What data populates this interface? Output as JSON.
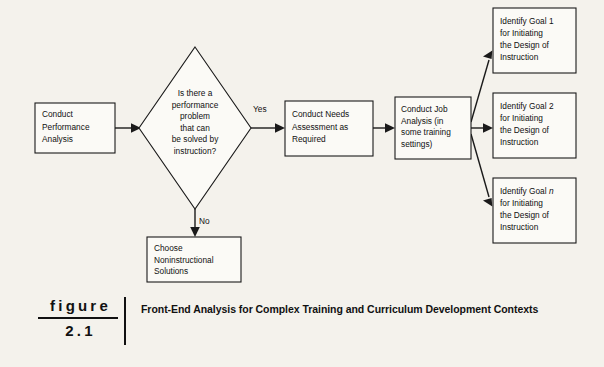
{
  "figure": {
    "label_word": "figure",
    "number": "2.1",
    "title": "Front-End Analysis for Complex Training and Curriculum Development Contexts"
  },
  "diagram": {
    "type": "flowchart",
    "nodes": [
      {
        "id": "conduct-performance-analysis",
        "shape": "rect",
        "lines": [
          "Conduct",
          "Performance",
          "Analysis"
        ],
        "x": 35,
        "y": 103,
        "w": 80,
        "h": 50
      },
      {
        "id": "decision-performance-problem",
        "shape": "diamond",
        "lines": [
          "Is there a",
          "performance",
          "problem",
          "that can",
          "be solved by",
          "instruction?"
        ],
        "cx": 195,
        "cy": 128,
        "rx": 56,
        "ry": 81
      },
      {
        "id": "choose-noninstructional-solutions",
        "shape": "rect",
        "lines": [
          "Choose",
          "Noninstructional",
          "Solutions"
        ],
        "x": 147,
        "y": 237,
        "w": 94,
        "h": 45
      },
      {
        "id": "conduct-needs-assessment",
        "shape": "rect",
        "lines": [
          "Conduct Needs",
          "Assessment as",
          "Required"
        ],
        "x": 285,
        "y": 101,
        "w": 88,
        "h": 55
      },
      {
        "id": "conduct-job-analysis",
        "shape": "rect",
        "lines": [
          "Conduct Job",
          "Analysis (in",
          "some training",
          "settings)"
        ],
        "x": 395,
        "y": 97,
        "w": 76,
        "h": 62
      },
      {
        "id": "identify-goal-1",
        "shape": "rect",
        "lines": [
          "Identify Goal 1",
          "for Initiating",
          "the Design of",
          "Instruction"
        ],
        "x": 493,
        "y": 8,
        "w": 83,
        "h": 65
      },
      {
        "id": "identify-goal-2",
        "shape": "rect",
        "lines": [
          "Identify Goal 2",
          "for Initiating",
          "the Design of",
          "Instruction"
        ],
        "x": 493,
        "y": 93,
        "w": 83,
        "h": 65
      },
      {
        "id": "identify-goal-n",
        "shape": "rect",
        "lines": [
          "Identify Goal n",
          "for Initiating",
          "the Design of",
          "Instruction"
        ],
        "italic_token": "n",
        "x": 493,
        "y": 178,
        "w": 83,
        "h": 65
      }
    ],
    "edges": [
      {
        "id": "edge-analysis-to-decision",
        "from": "conduct-performance-analysis",
        "to": "decision-performance-problem",
        "label": ""
      },
      {
        "id": "edge-decision-yes",
        "from": "decision-performance-problem",
        "to": "conduct-needs-assessment",
        "label": "Yes"
      },
      {
        "id": "edge-decision-no",
        "from": "decision-performance-problem",
        "to": "choose-noninstructional-solutions",
        "label": "No"
      },
      {
        "id": "edge-needs-to-job",
        "from": "conduct-needs-assessment",
        "to": "conduct-job-analysis",
        "label": ""
      },
      {
        "id": "edge-job-to-goal1",
        "from": "conduct-job-analysis",
        "to": "identify-goal-1",
        "label": ""
      },
      {
        "id": "edge-job-to-goal2",
        "from": "conduct-job-analysis",
        "to": "identify-goal-2",
        "label": ""
      },
      {
        "id": "edge-job-to-goaln",
        "from": "conduct-job-analysis",
        "to": "identify-goal-n",
        "label": ""
      }
    ],
    "labels": {
      "yes": "Yes",
      "no": "No"
    }
  },
  "colors": {
    "page_background": "#f4f2ec",
    "node_fill": "#fbfaf6",
    "stroke": "#1a1a1a",
    "text": "#101010"
  }
}
